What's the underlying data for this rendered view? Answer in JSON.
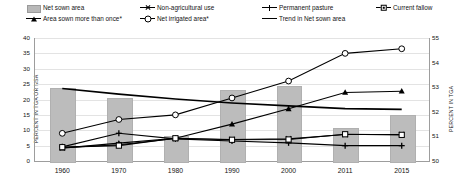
{
  "legend": {
    "items": [
      {
        "label": "Net sown area",
        "key": "bar-swatch",
        "row": 0,
        "col": 0
      },
      {
        "label": "Non-agricultural use",
        "key": "x-marker-line",
        "row": 0,
        "col": 1
      },
      {
        "label": "Permanent pasture",
        "key": "plus-marker-line",
        "row": 0,
        "col": 2
      },
      {
        "label": "Current fallow",
        "key": "square-dot-marker-line",
        "row": 0,
        "col": 3
      },
      {
        "label": "Area sown more than once*",
        "key": "triangle-marker-line",
        "row": 1,
        "col": 0
      },
      {
        "label": "Net irrigated area*",
        "key": "circle-marker-line",
        "row": 1,
        "col": 1
      },
      {
        "label": "Trend in Net sown area",
        "key": "plain-line",
        "row": 1,
        "col": 2
      }
    ]
  },
  "chart_data": {
    "type": "bar",
    "title": "",
    "xlabel": "",
    "ylabel": "PERCENT IN TGA OR NSA",
    "ylabel_right": "PERCENT IN TGA",
    "categories": [
      "1960",
      "1970",
      "1980",
      "1990",
      "2000",
      "2011",
      "2015"
    ],
    "ylim": [
      0,
      40
    ],
    "yticks": [
      0,
      5,
      10,
      15,
      20,
      25,
      30,
      35,
      40
    ],
    "ylim_right": [
      50,
      55
    ],
    "yticks_right": [
      50,
      51,
      52,
      53,
      54,
      55
    ],
    "grid": true,
    "legend_position": "top",
    "series": [
      {
        "name": "Net sown area",
        "type": "bar",
        "axis": "right",
        "color": "#bcbcbc",
        "values": [
          52.95,
          52.55,
          51.0,
          52.9,
          53.05,
          51.35,
          51.85
        ]
      },
      {
        "name": "Trend in Net sown area",
        "type": "line",
        "axis": "right",
        "marker": "none",
        "color": "#000000",
        "values": [
          52.95,
          52.72,
          52.52,
          52.36,
          52.24,
          52.13,
          52.1
        ]
      },
      {
        "name": "Net irrigated area*",
        "type": "line",
        "axis": "left",
        "marker": "circle",
        "color": "#000000",
        "values": [
          9.0,
          13.5,
          15.0,
          20.5,
          26.0,
          35.0,
          36.5
        ]
      },
      {
        "name": "Area sown more than once*",
        "type": "line",
        "axis": "left",
        "marker": "triangle",
        "color": "#000000",
        "values": [
          4.2,
          5.8,
          7.4,
          12.0,
          17.0,
          22.3,
          22.7
        ]
      },
      {
        "name": "Non-agricultural use",
        "type": "line",
        "axis": "left",
        "marker": "x",
        "color": "#000000",
        "values": [
          4.3,
          5.3,
          7.3,
          7.0,
          7.2,
          8.6,
          8.6
        ]
      },
      {
        "name": "Permanent pasture",
        "type": "line",
        "axis": "left",
        "marker": "plus",
        "color": "#000000",
        "values": [
          4.6,
          9.0,
          7.2,
          6.5,
          5.9,
          5.0,
          5.0
        ]
      },
      {
        "name": "Current fallow",
        "type": "line",
        "axis": "left",
        "marker": "square",
        "color": "#000000",
        "values": [
          4.5,
          5.0,
          7.4,
          6.9,
          7.0,
          8.7,
          8.5
        ]
      }
    ]
  }
}
